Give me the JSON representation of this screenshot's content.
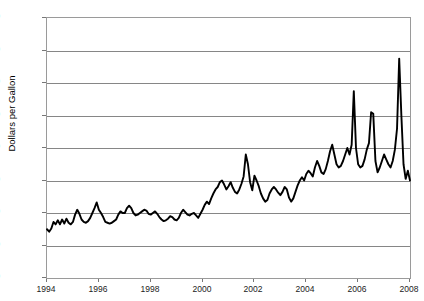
{
  "chart_data": {
    "type": "line",
    "title": "Natural Gas Wellhead Price",
    "xlabel": "",
    "ylabel": "Dollars per Gallon",
    "xlim": [
      1994.0,
      2008.0
    ],
    "ylim": [
      0.0,
      1.6
    ],
    "grid": true,
    "legend": "none",
    "y_ticks": [
      "0.000",
      "0.200",
      "0.400",
      "0.600",
      "0.800",
      "1.000",
      "1.200",
      "1.400",
      "1.600"
    ],
    "y_tick_values": [
      0.0,
      0.2,
      0.4,
      0.6,
      0.8,
      1.0,
      1.2,
      1.4,
      1.6
    ],
    "x_ticks": [
      "1994",
      "1996",
      "1998",
      "2000",
      "2002",
      "2004",
      "2006",
      "2008"
    ],
    "x_tick_values": [
      1994,
      1996,
      1998,
      2000,
      2002,
      2004,
      2006,
      2008
    ],
    "line_color": "#000000",
    "grid_color": "#868686",
    "series": [
      {
        "name": "Dollars per Gallon",
        "x": [
          1994.0,
          1994.083,
          1994.167,
          1994.25,
          1994.333,
          1994.417,
          1994.5,
          1994.583,
          1994.667,
          1994.75,
          1994.833,
          1994.917,
          1995.0,
          1995.083,
          1995.167,
          1995.25,
          1995.333,
          1995.417,
          1995.5,
          1995.583,
          1995.667,
          1995.75,
          1995.833,
          1995.917,
          1996.0,
          1996.083,
          1996.167,
          1996.25,
          1996.333,
          1996.417,
          1996.5,
          1996.583,
          1996.667,
          1996.75,
          1996.833,
          1996.917,
          1997.0,
          1997.083,
          1997.167,
          1997.25,
          1997.333,
          1997.417,
          1997.5,
          1997.583,
          1997.667,
          1997.75,
          1997.833,
          1997.917,
          1998.0,
          1998.083,
          1998.167,
          1998.25,
          1998.333,
          1998.417,
          1998.5,
          1998.583,
          1998.667,
          1998.75,
          1998.833,
          1998.917,
          1999.0,
          1999.083,
          1999.167,
          1999.25,
          1999.333,
          1999.417,
          1999.5,
          1999.583,
          1999.667,
          1999.75,
          1999.833,
          1999.917,
          2000.0,
          2000.083,
          2000.167,
          2000.25,
          2000.333,
          2000.417,
          2000.5,
          2000.583,
          2000.667,
          2000.75,
          2000.833,
          2000.917,
          2001.0,
          2001.083,
          2001.167,
          2001.25,
          2001.333,
          2001.417,
          2001.5,
          2001.583,
          2001.667,
          2001.75,
          2001.833,
          2001.917,
          2002.0,
          2002.083,
          2002.167,
          2002.25,
          2002.333,
          2002.417,
          2002.5,
          2002.583,
          2002.667,
          2002.75,
          2002.833,
          2002.917,
          2003.0,
          2003.083,
          2003.167,
          2003.25,
          2003.333,
          2003.417,
          2003.5,
          2003.583,
          2003.667,
          2003.75,
          2003.833,
          2003.917,
          2004.0,
          2004.083,
          2004.167,
          2004.25,
          2004.333,
          2004.417,
          2004.5,
          2004.583,
          2004.667,
          2004.75,
          2004.833,
          2004.917,
          2005.0,
          2005.083,
          2005.167,
          2005.25,
          2005.333,
          2005.417,
          2005.5,
          2005.583,
          2005.667,
          2005.75,
          2005.833,
          2005.917,
          2006.0,
          2006.083,
          2006.167,
          2006.25,
          2006.333,
          2006.417,
          2006.5,
          2006.583,
          2006.667,
          2006.75,
          2006.833,
          2006.917,
          2007.0,
          2007.083,
          2007.167,
          2007.25,
          2007.333,
          2007.417,
          2007.5,
          2007.583,
          2007.667,
          2007.75,
          2007.833,
          2007.917,
          2008.0
        ],
        "values": [
          0.3,
          0.285,
          0.305,
          0.345,
          0.33,
          0.355,
          0.33,
          0.36,
          0.335,
          0.365,
          0.34,
          0.33,
          0.345,
          0.39,
          0.42,
          0.395,
          0.36,
          0.345,
          0.34,
          0.35,
          0.37,
          0.4,
          0.43,
          0.465,
          0.42,
          0.4,
          0.375,
          0.345,
          0.34,
          0.335,
          0.34,
          0.35,
          0.36,
          0.39,
          0.41,
          0.4,
          0.4,
          0.43,
          0.445,
          0.43,
          0.4,
          0.385,
          0.39,
          0.4,
          0.41,
          0.42,
          0.415,
          0.395,
          0.39,
          0.4,
          0.41,
          0.395,
          0.375,
          0.36,
          0.35,
          0.355,
          0.365,
          0.38,
          0.375,
          0.36,
          0.355,
          0.37,
          0.4,
          0.42,
          0.405,
          0.39,
          0.385,
          0.395,
          0.4,
          0.385,
          0.37,
          0.395,
          0.42,
          0.45,
          0.47,
          0.455,
          0.49,
          0.52,
          0.545,
          0.56,
          0.59,
          0.6,
          0.575,
          0.545,
          0.565,
          0.59,
          0.555,
          0.53,
          0.52,
          0.545,
          0.58,
          0.625,
          0.76,
          0.7,
          0.59,
          0.54,
          0.63,
          0.6,
          0.565,
          0.52,
          0.49,
          0.47,
          0.48,
          0.52,
          0.545,
          0.56,
          0.545,
          0.525,
          0.51,
          0.53,
          0.56,
          0.545,
          0.495,
          0.47,
          0.49,
          0.53,
          0.57,
          0.6,
          0.62,
          0.6,
          0.64,
          0.66,
          0.645,
          0.625,
          0.68,
          0.72,
          0.69,
          0.65,
          0.64,
          0.67,
          0.72,
          0.78,
          0.82,
          0.76,
          0.7,
          0.68,
          0.69,
          0.72,
          0.76,
          0.8,
          0.76,
          0.82,
          1.15,
          0.8,
          0.7,
          0.68,
          0.69,
          0.73,
          0.79,
          0.83,
          1.02,
          1.01,
          0.72,
          0.65,
          0.68,
          0.72,
          0.76,
          0.73,
          0.7,
          0.68,
          0.72,
          0.79,
          0.92,
          1.35,
          1.0,
          0.7,
          0.61,
          0.66,
          0.6
        ]
      }
    ]
  },
  "axes": {
    "y_title": "Dollars per Gallon"
  }
}
